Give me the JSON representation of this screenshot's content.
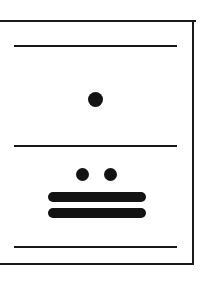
{
  "plate": {
    "title": "Mayan numeral glyph plate",
    "background_color": "#ffffff",
    "ink_color": "#131313",
    "width": 208,
    "height": 281,
    "frame": {
      "label": "rectangular plate border",
      "stroke_color": "#1a1a1a",
      "stroke_width": 2,
      "left_edge_cropped": "yes"
    }
  },
  "registers": [
    {
      "name": "upper-register",
      "rule_label": "register rule 1",
      "glyph": {
        "name": "numeral-one",
        "value": "1",
        "dots": 1,
        "bars": 0
      }
    },
    {
      "name": "lower-register",
      "rule_label": "register rule 2",
      "glyph": {
        "name": "numeral-twelve",
        "value": "12",
        "dots": 2,
        "bars": 2
      }
    },
    {
      "name": "closing-rule",
      "rule_label": "register rule 3"
    }
  ],
  "rules": [
    {
      "name": "rule-top",
      "x": 14,
      "y": 45,
      "width": 163,
      "height": 2
    },
    {
      "name": "rule-middle",
      "x": 14,
      "y": 145,
      "width": 163,
      "height": 2
    },
    {
      "name": "rule-bottom",
      "x": 14,
      "y": 246,
      "width": 163,
      "height": 2
    }
  ],
  "dots": [
    {
      "name": "dot-upper",
      "cx": 95,
      "cy": 99,
      "d": 15
    },
    {
      "name": "dot-lower-left",
      "cx": 82,
      "cy": 174,
      "d": 13
    },
    {
      "name": "dot-lower-right",
      "cx": 110,
      "cy": 174,
      "d": 13
    }
  ],
  "bars": [
    {
      "name": "bar-upper",
      "x": 48,
      "y": 192,
      "width": 98,
      "height": 10
    },
    {
      "name": "bar-lower",
      "x": 48,
      "y": 208,
      "width": 98,
      "height": 10
    }
  ]
}
